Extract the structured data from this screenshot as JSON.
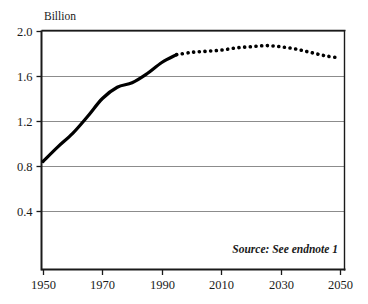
{
  "chart_data": {
    "type": "line",
    "title": "",
    "subtitle": "",
    "xlabel": "",
    "ylabel": "Billion",
    "unit_label": "Billion",
    "source_note": "Source: See endnote 1",
    "grid": true,
    "legend": "none",
    "xlim": [
      1950,
      2050
    ],
    "ylim": [
      0.0,
      2.0
    ],
    "y_ticks": [
      "2.0",
      "1.6",
      "1.2",
      "0.8",
      "0.4"
    ],
    "y_tick_values": [
      2.0,
      1.6,
      1.2,
      0.8,
      0.4
    ],
    "x_ticks": [
      "1950",
      "1970",
      "1990",
      "2010",
      "2030",
      "2050"
    ],
    "x_tick_values": [
      1950,
      1970,
      1990,
      2010,
      2030,
      2050
    ],
    "series": [
      {
        "name": "Historical",
        "style": "solid",
        "color": "#000000",
        "x": [
          1950,
          1955,
          1960,
          1965,
          1970,
          1975,
          1980,
          1985,
          1990,
          1995
        ],
        "values": [
          0.84,
          0.97,
          1.09,
          1.24,
          1.4,
          1.5,
          1.54,
          1.62,
          1.72,
          1.79
        ]
      },
      {
        "name": "Projected",
        "style": "dotted",
        "color": "#000000",
        "x": [
          1995,
          2000,
          2005,
          2010,
          2015,
          2020,
          2025,
          2030,
          2035,
          2040,
          2045,
          2050
        ],
        "values": [
          1.79,
          1.81,
          1.82,
          1.83,
          1.85,
          1.86,
          1.87,
          1.86,
          1.84,
          1.81,
          1.78,
          1.76
        ]
      }
    ],
    "colors": {
      "line": "#000000",
      "grid": "#8c8c8c",
      "axis": "#1a1a1a",
      "background": "#ffffff"
    }
  }
}
